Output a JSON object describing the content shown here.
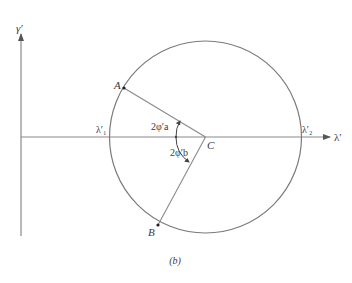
{
  "figure": {
    "caption": "(b)",
    "axes": {
      "vertical_label": "γ′",
      "horizontal_label": "λ′"
    },
    "circle": {
      "center_label": "C",
      "left_intersection_label": "λ′₁",
      "right_intersection_label": "λ′₂"
    },
    "points": {
      "A": "A",
      "B": "B"
    },
    "angles": {
      "upper": "2φ′a",
      "lower": "2φ′b"
    },
    "colors": {
      "line": "#8a8a8a",
      "text": "#3a3a3a",
      "background": "#ffffff"
    }
  }
}
